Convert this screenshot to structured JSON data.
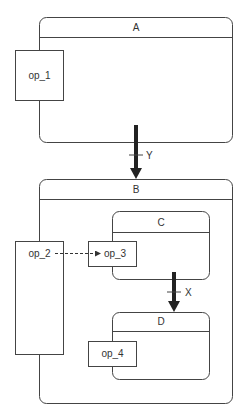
{
  "diagram": {
    "type": "statechart",
    "states": {
      "A": {
        "label": "A"
      },
      "B": {
        "label": "B"
      },
      "C": {
        "label": "C"
      },
      "D": {
        "label": "D"
      }
    },
    "operations": {
      "op_1": {
        "label": "op_1"
      },
      "op_2": {
        "label": "op_2"
      },
      "op_3": {
        "label": "op_3"
      },
      "op_4": {
        "label": "op_4"
      }
    },
    "transitions": {
      "Y": {
        "label": "Y",
        "from": "A",
        "to": "B"
      },
      "X": {
        "label": "X",
        "from": "C",
        "to": "D"
      }
    },
    "flows": [
      {
        "from": "op_2",
        "to": "op_3",
        "style": "dashed"
      }
    ],
    "colors": {
      "stroke": "#444444",
      "arrow": "#333333",
      "background": "#ffffff"
    }
  }
}
